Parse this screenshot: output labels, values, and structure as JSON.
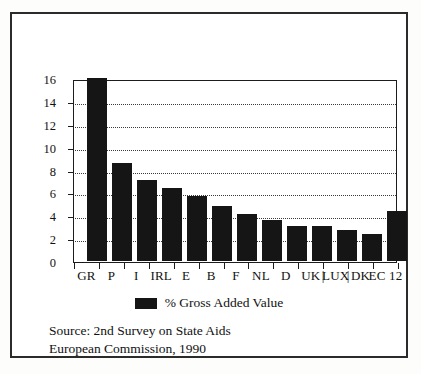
{
  "figure": {
    "legend_label": "% Gross Added Value",
    "source_line1": "Source: 2nd Survey on State Aids",
    "source_line2": "European Commission, 1990",
    "bar_color": "#151515",
    "frame_color": "#2b2b2b",
    "grid_color": "#3a3a3a"
  },
  "chart_data": {
    "type": "bar",
    "title": "",
    "xlabel": "",
    "ylabel": "",
    "ylim": [
      0,
      16
    ],
    "yticks": [
      0,
      2,
      4,
      6,
      8,
      10,
      12,
      14,
      16
    ],
    "ytick_labels": [
      "0",
      "2",
      "4",
      "6",
      "8",
      "10",
      "12",
      "14",
      "16"
    ],
    "grid": true,
    "grid_style": "dotted-horizontal",
    "legend": [
      "% Gross Added Value"
    ],
    "legend_position": "below-axes-center",
    "categories": [
      "GR",
      "P",
      "I",
      "IRL",
      "E",
      "B",
      "F",
      "NL",
      "D",
      "UK",
      "LUX",
      "DK",
      "EC 12"
    ],
    "separators_after": [
      "UK",
      "LUX"
    ],
    "series": [
      {
        "name": "% Gross Added Value",
        "values": [
          16.0,
          8.6,
          7.1,
          6.4,
          5.7,
          4.8,
          4.1,
          3.6,
          3.1,
          3.1,
          2.7,
          2.4,
          4.4
        ]
      }
    ],
    "annotations": [
      "Source: 2nd Survey on State Aids",
      "European Commission, 1990"
    ]
  }
}
